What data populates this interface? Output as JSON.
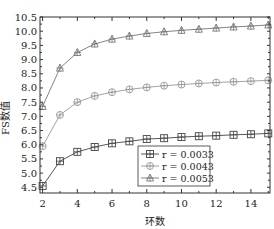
{
  "chart_data": {
    "type": "line",
    "title": "",
    "xlabel": "环数",
    "ylabel": "FS数值",
    "x": [
      2,
      3,
      4,
      5,
      6,
      7,
      8,
      9,
      10,
      11,
      12,
      13,
      14,
      15
    ],
    "xlim": [
      1.85,
      15.1
    ],
    "ylim": [
      4.3,
      10.5
    ],
    "xticks": [
      2,
      4,
      6,
      8,
      10,
      12,
      14
    ],
    "yticks": [
      4.5,
      5.0,
      5.5,
      6.0,
      6.5,
      7.0,
      7.5,
      8.0,
      8.5,
      9.0,
      9.5,
      10.0,
      10.5
    ],
    "ytick_labels": [
      "4.5",
      "5.0",
      "5.5",
      "6.0",
      "6.5",
      "7.0",
      "7.5",
      "8.0",
      "8.5",
      "9.0",
      "9.5",
      "10.0",
      "10.5"
    ],
    "grid": false,
    "legend_position": "lower right",
    "series": [
      {
        "name": "r = 0.0033",
        "marker": "square",
        "color": "#444444",
        "values": [
          4.55,
          5.42,
          5.75,
          5.92,
          6.05,
          6.12,
          6.2,
          6.23,
          6.27,
          6.3,
          6.32,
          6.35,
          6.37,
          6.4
        ]
      },
      {
        "name": "r = 0.0043",
        "marker": "circle",
        "color": "#999999",
        "values": [
          5.95,
          7.05,
          7.5,
          7.72,
          7.85,
          7.95,
          8.02,
          8.08,
          8.12,
          8.16,
          8.19,
          8.22,
          8.24,
          8.27
        ]
      },
      {
        "name": "r = 0.0053",
        "marker": "triangle",
        "color": "#777777",
        "values": [
          7.35,
          8.7,
          9.25,
          9.55,
          9.72,
          9.83,
          9.92,
          9.98,
          10.03,
          10.07,
          10.11,
          10.15,
          10.18,
          10.22
        ]
      }
    ]
  },
  "axes": {
    "xlabel": "环数",
    "ylabel": "FS数值"
  },
  "legend": {
    "items": [
      {
        "label": "r = 0.0033"
      },
      {
        "label": "r = 0.0043"
      },
      {
        "label": "r = 0.0053"
      }
    ]
  }
}
